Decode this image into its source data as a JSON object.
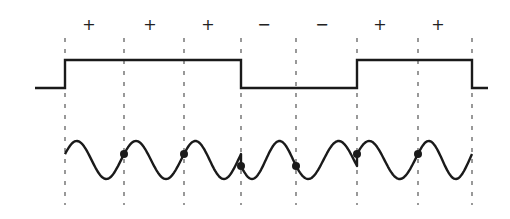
{
  "diagram": {
    "colors": {
      "line": "#1a1a1a",
      "dash": "#555555",
      "background": "#ffffff"
    },
    "bit_boundaries_x": [
      65,
      124,
      184,
      241,
      296,
      357,
      418,
      472
    ],
    "signs": [
      {
        "label": "+",
        "x": 89
      },
      {
        "label": "+",
        "x": 150
      },
      {
        "label": "+",
        "x": 208
      },
      {
        "label": "−",
        "x": 264
      },
      {
        "label": "−",
        "x": 322
      },
      {
        "label": "+",
        "x": 380
      },
      {
        "label": "+",
        "x": 438
      }
    ],
    "sign_y": 25,
    "square_wave": {
      "high_y": 60,
      "low_y": 88,
      "points": [
        [
          35,
          88
        ],
        [
          65,
          88
        ],
        [
          65,
          60
        ],
        [
          241,
          60
        ],
        [
          241,
          88
        ],
        [
          357,
          88
        ],
        [
          357,
          60
        ],
        [
          472,
          60
        ],
        [
          472,
          88
        ],
        [
          488,
          88
        ]
      ]
    },
    "carrier": {
      "center_y": 160,
      "amplitude": 19,
      "x_start": 65,
      "x_end": 472,
      "dots_x": [
        124,
        184,
        241,
        296,
        357,
        418
      ]
    },
    "dash_y_range": [
      38,
      205
    ]
  }
}
